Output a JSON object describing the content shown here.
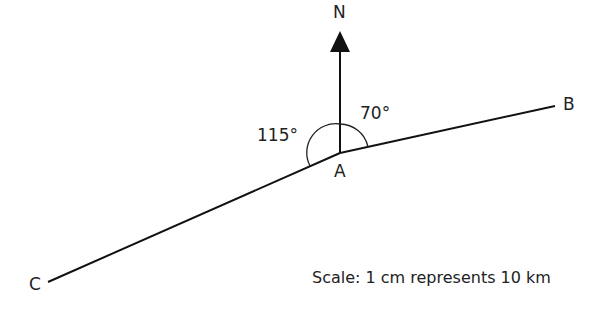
{
  "diagram": {
    "north_label": "N",
    "points": {
      "A": {
        "label": "A",
        "x": 340,
        "y": 153
      },
      "B": {
        "label": "B",
        "x": 555,
        "y": 106
      },
      "C": {
        "label": "C",
        "x": 48,
        "y": 282
      }
    },
    "angles": {
      "bearing_AB": "70°",
      "angle_N_A_C": "115°"
    },
    "scale_text": "Scale: 1 cm represents 10 km",
    "colors": {
      "line": "#111111",
      "text": "#222222"
    }
  }
}
